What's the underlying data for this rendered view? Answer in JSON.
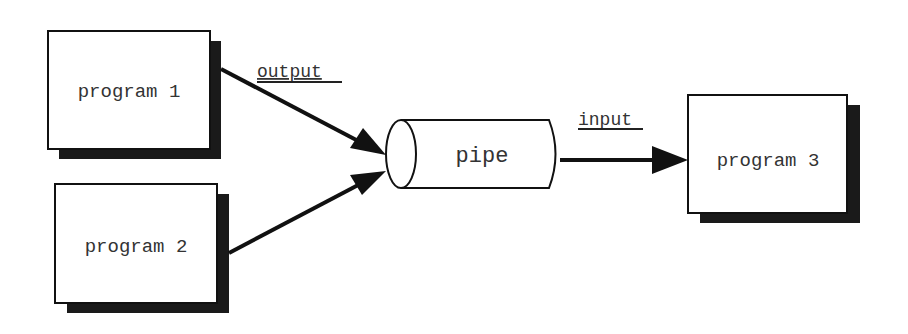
{
  "diagram": {
    "nodes": [
      {
        "id": "program1",
        "label": "program 1",
        "x": 48,
        "y": 31,
        "w": 162,
        "h": 118
      },
      {
        "id": "program2",
        "label": "program 2",
        "x": 55,
        "y": 184,
        "w": 162,
        "h": 119
      },
      {
        "id": "program3",
        "label": "program 3",
        "x": 688,
        "y": 95,
        "w": 159,
        "h": 118
      }
    ],
    "pipe": {
      "label": "pipe"
    },
    "edges": [
      {
        "from": "program1",
        "to": "pipe",
        "label": "output"
      },
      {
        "from": "program2",
        "to": "pipe",
        "label": ""
      },
      {
        "from": "pipe",
        "to": "program3",
        "label": "input"
      }
    ],
    "colors": {
      "stroke": "#111111",
      "shadow": "#1a1a1a",
      "fill": "#ffffff",
      "text": "#333333"
    }
  }
}
